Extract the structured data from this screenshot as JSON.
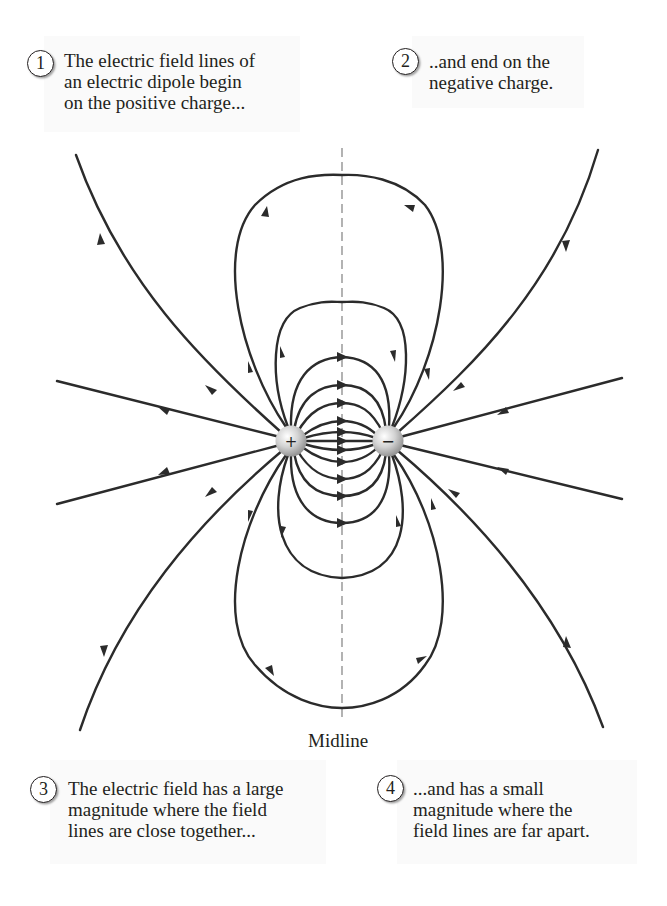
{
  "figure": {
    "title": "Electric field lines of an electric dipole",
    "midline_label": "Midline",
    "charges": [
      {
        "sign": "+",
        "label": "+",
        "role": "positive-charge"
      },
      {
        "sign": "-",
        "label": "−",
        "role": "negative-charge"
      }
    ],
    "line_color": "#2b2b2b",
    "midline_color": "#8a8a8a"
  },
  "callouts": [
    {
      "number": "1",
      "text": "The electric field lines of\nan electric dipole begin\non the positive charge..."
    },
    {
      "number": "2",
      "text": "..and end on the\nnegative charge."
    },
    {
      "number": "3",
      "text": "The electric field has a large\nmagnitude where the field\nlines are close together..."
    },
    {
      "number": "4",
      "text": "...and has a small\nmagnitude where the\nfield lines are far apart."
    }
  ]
}
